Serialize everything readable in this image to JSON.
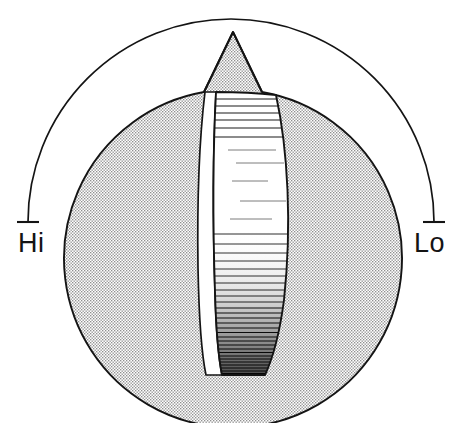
{
  "figure": {
    "kind": "technical-line-illustration",
    "background_color": "#ffffff",
    "ink_color": "#141414",
    "stipple_color": "#9a9a9a",
    "width": 468,
    "height": 423
  },
  "knob": {
    "body_name": "knob-body",
    "center_x": 231,
    "center_y": 231,
    "radius": 169,
    "fill_style": "stipple",
    "outline_color": "#141414"
  },
  "pointer": {
    "name": "knob-pointer",
    "shape": "triangle-spike",
    "tip_x": 233,
    "tip_y": 32,
    "base_left_x": 204,
    "base_right_x": 262,
    "base_y": 92,
    "label": ""
  },
  "thumbwheel": {
    "name": "ribbed-thumbwheel",
    "top_y": 92,
    "bottom_y": 375,
    "left_x": 209,
    "right_x": 285,
    "rib_count": 58,
    "shading": "gradient-dark-at-bottom",
    "highlight": "white-crescent-left-edge"
  },
  "arc": {
    "name": "range-arc",
    "center_x": 231,
    "center_y": 231,
    "radius": 203,
    "start_angle_deg": 180,
    "end_angle_deg": 0,
    "sweep": "over-the-top",
    "stroke_color": "#141414",
    "stroke_width": 1.6
  },
  "ticks": [
    {
      "name": "tick-hi",
      "side": "left",
      "x": 28,
      "y": 222,
      "length": 22,
      "orientation": "horizontal"
    },
    {
      "name": "tick-lo",
      "side": "right",
      "x": 423,
      "y": 222,
      "length": 22,
      "orientation": "horizontal"
    }
  ],
  "labels": {
    "hi": {
      "text": "Hi",
      "x": 18,
      "y": 252,
      "anchor": "start",
      "meaning": "high-end-of-range"
    },
    "lo": {
      "text": "Lo",
      "x": 414,
      "y": 252,
      "anchor": "start",
      "meaning": "low-end-of-range"
    }
  }
}
